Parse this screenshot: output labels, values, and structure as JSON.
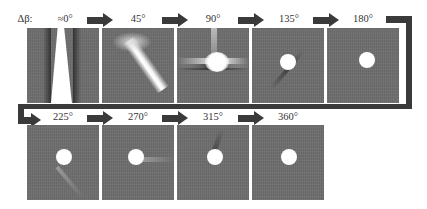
{
  "figure": {
    "prefix_label": "Δβ:",
    "row1": [
      {
        "label": "≈0°",
        "pattern": "wedge"
      },
      {
        "label": "45°",
        "pattern": "diagonal-streak"
      },
      {
        "label": "90°",
        "pattern": "cross-glow"
      },
      {
        "label": "135°",
        "pattern": "faint-diagonal"
      },
      {
        "label": "180°",
        "pattern": "dot"
      }
    ],
    "row2": [
      {
        "label": "225°",
        "pattern": "faint-tail"
      },
      {
        "label": "270°",
        "pattern": "faint-horizontal"
      },
      {
        "label": "315°",
        "pattern": "faint-tail"
      },
      {
        "label": "360°",
        "pattern": "dot"
      }
    ],
    "colors": {
      "panel_bg": "#6e6e6e",
      "arrow": "#3a3a3a",
      "highlight": "#ffffff"
    }
  }
}
